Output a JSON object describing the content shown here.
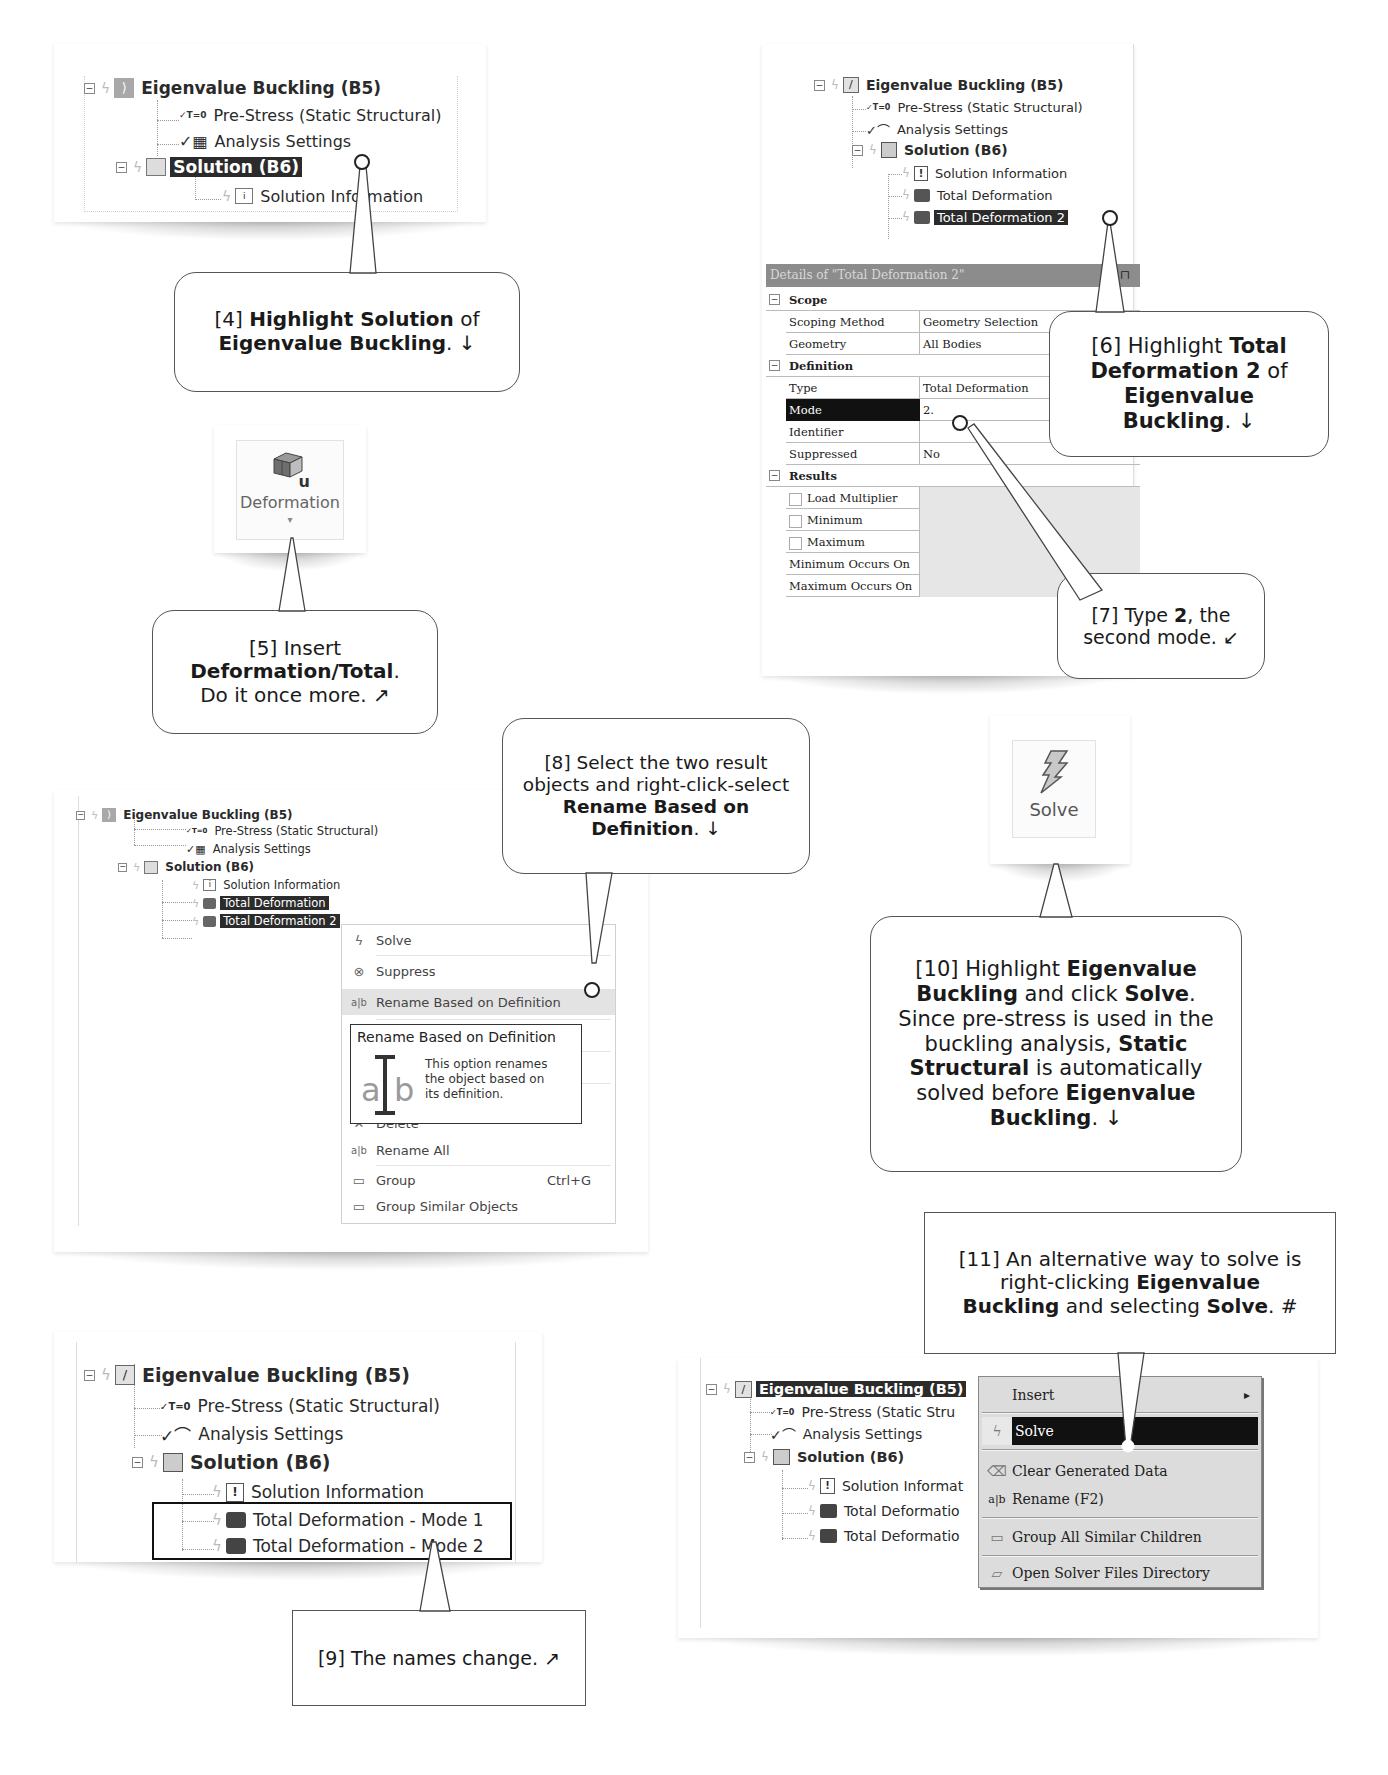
{
  "panel_step4": {
    "tree": [
      {
        "label": "Eigenvalue Buckling (B5)",
        "bold": true,
        "icon": "buckling-analysis-icon",
        "expander": "−"
      },
      {
        "label": "Pre-Stress (Static Structural)",
        "icon": "pre-stress-icon",
        "icon_text": "T=0"
      },
      {
        "label": "Analysis Settings",
        "icon": "analysis-settings-icon"
      },
      {
        "label": "Solution (B6)",
        "bold": true,
        "selected": true,
        "icon": "solution-icon",
        "expander": "−"
      },
      {
        "label": "Solution Information",
        "icon": "solution-information-icon"
      }
    ]
  },
  "callout4": {
    "step": "[4]",
    "pre": " ",
    "b1": "Highlight Solution",
    "mid": " of ",
    "b2": "Eigenvalue Buckling",
    "end": ". ↓"
  },
  "ribbon_deformation": {
    "icon": "deformation-icon",
    "icon_sub": "u",
    "label": "Deformation",
    "dropdown": "▾"
  },
  "callout5": {
    "step": "[5] Insert",
    "b1": "Deformation/Total",
    "end1": ".",
    "line3": "Do it once more. ↗"
  },
  "panel_step6": {
    "tree": [
      {
        "label": "Eigenvalue Buckling (B5)",
        "bold": true,
        "icon": "buckling-analysis-icon",
        "expander": "−"
      },
      {
        "label": "Pre-Stress (Static Structural)",
        "icon": "pre-stress-icon",
        "icon_text": "T=0"
      },
      {
        "label": "Analysis Settings",
        "icon": "analysis-settings-icon"
      },
      {
        "label": "Solution (B6)",
        "bold": true,
        "icon": "solution-icon",
        "expander": "−"
      },
      {
        "label": "Solution Information",
        "icon": "solution-information-icon"
      },
      {
        "label": "Total Deformation",
        "icon": "total-deformation-icon"
      },
      {
        "label": "Total Deformation 2",
        "selected": true,
        "icon": "total-deformation-icon"
      }
    ],
    "details": {
      "title": "Details of \"Total Deformation 2\"",
      "pin": "⊓",
      "rows": [
        {
          "type": "cat",
          "label": "Scope"
        },
        {
          "key": "Scoping Method",
          "value": "Geometry Selection"
        },
        {
          "key": "Geometry",
          "value": "All Bodies"
        },
        {
          "type": "cat",
          "label": "Definition"
        },
        {
          "key": "Type",
          "value": "Total Deformation"
        },
        {
          "key": "Mode",
          "value": "2.",
          "selected": true
        },
        {
          "key": "Identifier",
          "value": ""
        },
        {
          "key": "Suppressed",
          "value": "No"
        },
        {
          "type": "cat",
          "label": "Results"
        },
        {
          "key": "Load Multiplier",
          "value": "",
          "checkbox": true,
          "grey": true
        },
        {
          "key": "Minimum",
          "value": "",
          "checkbox": true,
          "grey": true
        },
        {
          "key": "Maximum",
          "value": "",
          "checkbox": true,
          "grey": true
        },
        {
          "key": "Minimum Occurs On",
          "value": "",
          "grey": true
        },
        {
          "key": "Maximum Occurs On",
          "value": "",
          "grey": true
        }
      ]
    }
  },
  "callout6": {
    "step": "[6] Highlight ",
    "b1": "Total",
    "b2": "Deformation 2",
    "mid": " of",
    "b3": "Eigenvalue",
    "b4": "Buckling",
    "end": ". ↓"
  },
  "callout7": {
    "step": "[7] Type ",
    "b1": "2",
    "mid": ", the",
    "line2": "second mode. ↙"
  },
  "panel_step8": {
    "tree": [
      {
        "label": "Eigenvalue Buckling (B5)",
        "bold": true,
        "icon": "buckling-analysis-icon",
        "expander": "−"
      },
      {
        "label": "Pre-Stress (Static Structural)",
        "icon": "pre-stress-icon",
        "icon_text": "T=0"
      },
      {
        "label": "Analysis Settings",
        "icon": "analysis-settings-icon"
      },
      {
        "label": "Solution (B6)",
        "bold": true,
        "icon": "solution-icon",
        "expander": "−"
      },
      {
        "label": "Solution Information",
        "icon": "solution-information-icon"
      },
      {
        "label": "Total Deformation",
        "selected": true,
        "icon": "total-deformation-icon"
      },
      {
        "label": "Total Deformation 2",
        "selected": true,
        "icon": "total-deformation-icon"
      }
    ],
    "context_menu": [
      {
        "label": "Solve",
        "icon": "solve-icon",
        "glyph": "ϟ"
      },
      {
        "label": "Suppress",
        "icon": "suppress-icon",
        "glyph": "⊗"
      },
      {
        "label": "Rename Based on Definition",
        "icon": "rename-icon",
        "glyph": "a|b",
        "highlighted": true
      },
      {
        "label": "Delete",
        "icon": "delete-icon",
        "glyph": "✕"
      },
      {
        "label": "Rename All",
        "icon": "rename-icon",
        "glyph": "a|b"
      },
      {
        "label": "Group",
        "icon": "folder-icon",
        "glyph": "▭",
        "shortcut": "Ctrl+G"
      },
      {
        "label": "Group Similar Objects",
        "icon": "folder-icon",
        "glyph": "▭"
      }
    ],
    "tooltip": {
      "title": "Rename Based on Definition",
      "icon_a": "a",
      "icon_b": "b",
      "line1": "This option renames",
      "line2": "the object based on",
      "line3": "its definition."
    }
  },
  "callout8": {
    "line1": "[8] Select the two result",
    "line2": "objects and right-click-select",
    "b1": "Rename Based on",
    "b2": "Definition",
    "end": ". ↓"
  },
  "ribbon_solve": {
    "icon": "solve-icon",
    "glyph": "ϟ",
    "label": "Solve"
  },
  "callout10": {
    "step": "[10] Highlight ",
    "b1": "Eigenvalue",
    "b2": "Buckling",
    "mid1": " and click ",
    "b3": "Solve",
    "end1": ".",
    "line3": "Since pre-stress is used in the",
    "line4": "buckling analysis, ",
    "b4": "Static",
    "b5": "Structural",
    "line5": " is automatically",
    "line6": "solved before ",
    "b6": "Eigenvalue",
    "b7": "Buckling",
    "end2": ". ↓"
  },
  "panel_step9": {
    "tree": [
      {
        "label": "Eigenvalue Buckling (B5)",
        "bold": true,
        "icon": "buckling-analysis-icon",
        "expander": "−"
      },
      {
        "label": "Pre-Stress (Static Structural)",
        "icon": "pre-stress-icon",
        "icon_text": "T=0"
      },
      {
        "label": "Analysis Settings",
        "icon": "analysis-settings-icon"
      },
      {
        "label": "Solution (B6)",
        "bold": true,
        "icon": "solution-icon",
        "expander": "−"
      },
      {
        "label": "Solution Information",
        "icon": "solution-information-icon"
      },
      {
        "label": "Total Deformation - Mode 1",
        "icon": "total-deformation-icon"
      },
      {
        "label": "Total Deformation - Mode 2",
        "icon": "total-deformation-icon"
      }
    ]
  },
  "callout9": {
    "text": "[9] The names change. ↗"
  },
  "callout11": {
    "line1": "[11] An alternative way to solve is",
    "line2": "right-clicking ",
    "b1": "Eigenvalue",
    "b2": "Buckling",
    "mid": " and selecting ",
    "b3": "Solve",
    "end": ".  #"
  },
  "panel_step11": {
    "tree": [
      {
        "label": "Eigenvalue Buckling (B5)",
        "bold": true,
        "selected": true,
        "icon": "buckling-analysis-icon",
        "expander": "−"
      },
      {
        "label": "Pre-Stress (Static Stru",
        "icon": "pre-stress-icon",
        "icon_text": "T=0"
      },
      {
        "label": "Analysis Settings",
        "icon": "analysis-settings-icon"
      },
      {
        "label": "Solution (B6)",
        "bold": true,
        "icon": "solution-icon",
        "expander": "−"
      },
      {
        "label": "Solution Informat",
        "icon": "solution-information-icon"
      },
      {
        "label": "Total Deformatio",
        "icon": "total-deformation-icon"
      },
      {
        "label": "Total Deformatio",
        "icon": "total-deformation-icon"
      }
    ],
    "context_menu": [
      {
        "label": "Insert",
        "submenu": "▸"
      },
      {
        "label": "Solve",
        "icon": "solve-icon",
        "glyph": "ϟ",
        "highlighted": true
      },
      {
        "label": "Clear Generated Data",
        "icon": "eraser-icon",
        "glyph": "⌫"
      },
      {
        "label": "Rename (F2)",
        "icon": "rename-icon",
        "glyph": "a|b"
      },
      {
        "label": "Group All Similar Children",
        "icon": "folder-icon",
        "glyph": "▭"
      },
      {
        "label": "Open Solver Files Directory",
        "icon": "folder-open-icon",
        "glyph": "▱"
      }
    ]
  },
  "colors": {
    "selection": "#2b2b2b",
    "panel_bg": "#ffffff",
    "callout_border": "#555555",
    "details_header": "#8c8c8c",
    "classic_menu_bg": "#dcdcdc"
  }
}
